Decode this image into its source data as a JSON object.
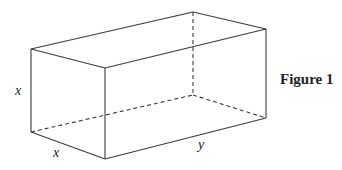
{
  "figure": {
    "caption": "Figure 1",
    "shape": "rectangular-box",
    "labels": {
      "height": "x",
      "depth": "x",
      "length": "y"
    }
  },
  "colors": {
    "line": "#3a3a3a",
    "text": "#222222",
    "background": "#ffffff"
  }
}
